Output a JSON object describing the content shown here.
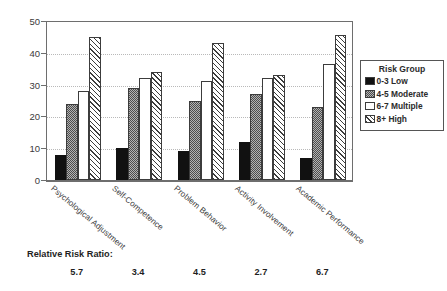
{
  "chart_data": {
    "type": "bar",
    "title": "",
    "subtitle": "",
    "xlabel": "",
    "ylabel": "",
    "ylim": [
      0,
      50
    ],
    "yticks": [
      0,
      10,
      20,
      30,
      40,
      50
    ],
    "grid": "horizontal-dotted",
    "legend_position": "right",
    "legend_title": "Risk Group",
    "categories": [
      "Psychological Adjustment",
      "Self-Competence",
      "Problem Behavior",
      "Activity Involvement",
      "Academic Performance"
    ],
    "series": [
      {
        "name": "0-3 Low",
        "pattern": "solid-black",
        "values": [
          8,
          10,
          9,
          12,
          7
        ]
      },
      {
        "name": "4-5 Moderate",
        "pattern": "stipple-gray",
        "values": [
          24,
          29,
          25,
          27,
          23
        ]
      },
      {
        "name": "6-7 Multiple",
        "pattern": "white-empty",
        "values": [
          28,
          32,
          31,
          32,
          36.5
        ]
      },
      {
        "name": "8+  High",
        "pattern": "diagonal-hatch",
        "values": [
          45,
          34,
          43,
          33,
          45.5
        ]
      }
    ],
    "annotations": {
      "footer_label": "Relative Risk Ratio:",
      "footer_values": [
        "5.7",
        "3.4",
        "4.5",
        "2.7",
        "6.7"
      ]
    }
  }
}
